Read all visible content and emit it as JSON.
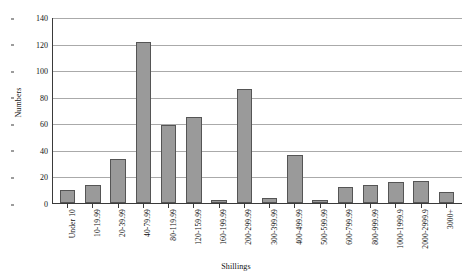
{
  "chart_data": {
    "type": "bar",
    "title": "",
    "xlabel": "Shillings",
    "ylabel": "Numbers",
    "ylim": [
      0,
      140
    ],
    "ytick_step": 20,
    "yticks": [
      0,
      20,
      40,
      60,
      80,
      100,
      120,
      140
    ],
    "grid": true,
    "legend": "none",
    "bar_color": "#9a9a9a",
    "bar_edge_color": "#555555",
    "axis_color": "#3a3a3a",
    "gridline_color": "#aaaaaa",
    "categories": [
      "Under 10",
      "10-19.99",
      "20-39.99",
      "40-79.99",
      "80-119.99",
      "120-159.99",
      "160-199.99",
      "200-299.99",
      "300-399.99",
      "400-499.99",
      "500-599.99",
      "600-799.99",
      "800-999.99",
      "1000-1999.9",
      "2000-2999.9",
      "3000+"
    ],
    "values": [
      10,
      14,
      33,
      122,
      59,
      65,
      2,
      86,
      4,
      36,
      2,
      12,
      14,
      16,
      17,
      8
    ]
  }
}
